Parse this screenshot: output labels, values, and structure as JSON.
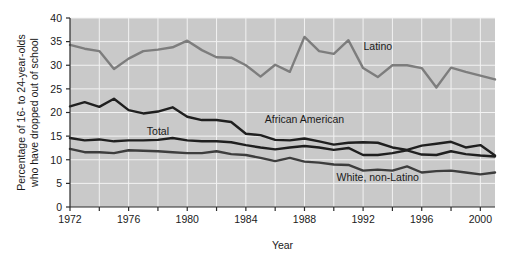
{
  "chart_data": {
    "type": "line",
    "title": "",
    "xlabel": "Year",
    "ylabel": "Percentage of 16- to 24-year-olds who have dropped out of school",
    "ylabel_line1": "Percentage of 16- to 24-year-olds",
    "ylabel_line2": "who have dropped out of school",
    "xlim": [
      1972,
      2001
    ],
    "ylim": [
      0,
      40
    ],
    "yticks": [
      0,
      5,
      10,
      15,
      20,
      25,
      30,
      35,
      40
    ],
    "ytick_labels": [
      "0",
      "5",
      "10",
      "15",
      "20",
      "25",
      "30",
      "35",
      "40"
    ],
    "xticks": [
      1972,
      1974,
      1976,
      1978,
      1980,
      1982,
      1984,
      1986,
      1988,
      1990,
      1992,
      1994,
      1996,
      1998,
      2000
    ],
    "xtick_labels": [
      "1972",
      "",
      "1976",
      "",
      "1980",
      "",
      "1984",
      "",
      "1988",
      "",
      "1992",
      "",
      "1996",
      "",
      "2000"
    ],
    "xtick_labels_shown": [
      "1972",
      "1976",
      "1980",
      "1984",
      "1988",
      "1992",
      "1996",
      "2000"
    ],
    "grid": true,
    "grid_color": "#f2f2f2",
    "plot_background": "#c9c9c9",
    "legend_position": "inline-annotations",
    "x": [
      1972,
      1973,
      1974,
      1975,
      1976,
      1977,
      1978,
      1979,
      1980,
      1981,
      1982,
      1983,
      1984,
      1985,
      1986,
      1987,
      1988,
      1989,
      1990,
      1991,
      1992,
      1993,
      1994,
      1995,
      1996,
      1997,
      1998,
      1999,
      2000,
      2001
    ],
    "series": [
      {
        "name": "Latino",
        "color": "#7d7d7d",
        "stroke_width": 2.4,
        "label_x": 1993,
        "label_y": 33.2,
        "values": [
          34.3,
          33.5,
          33.0,
          29.2,
          31.4,
          33.0,
          33.3,
          33.8,
          35.2,
          33.2,
          31.7,
          31.6,
          30.0,
          27.6,
          30.1,
          28.6,
          36.0,
          33.0,
          32.4,
          35.3,
          29.4,
          27.5,
          30.0,
          30.0,
          29.4,
          25.3,
          29.5,
          28.6,
          27.8,
          27.0
        ]
      },
      {
        "name": "African American",
        "color": "#1f1f1f",
        "stroke_width": 2.4,
        "label_x": 1988,
        "label_y": 17.8,
        "values": [
          21.3,
          22.2,
          21.2,
          22.9,
          20.5,
          19.8,
          20.2,
          21.1,
          19.1,
          18.4,
          18.4,
          18.0,
          15.5,
          15.2,
          14.2,
          14.1,
          14.5,
          13.9,
          13.2,
          13.6,
          13.7,
          13.6,
          12.6,
          12.1,
          13.0,
          13.4,
          13.8,
          12.6,
          13.1,
          10.9
        ]
      },
      {
        "name": "Total",
        "color": "#1f1f1f",
        "stroke_width": 2.4,
        "label_x": 1978,
        "label_y": 15.3,
        "values": [
          14.6,
          14.1,
          14.3,
          13.9,
          14.1,
          14.1,
          14.2,
          14.6,
          14.1,
          13.9,
          13.9,
          13.7,
          13.1,
          12.6,
          12.2,
          12.6,
          12.9,
          12.6,
          12.1,
          12.5,
          11.0,
          11.0,
          11.4,
          12.0,
          11.1,
          11.0,
          11.8,
          11.2,
          10.9,
          10.7
        ]
      },
      {
        "name": "White, non-Latino",
        "color": "#3d3d3d",
        "stroke_width": 2.4,
        "label_x": 1993,
        "label_y": 5.6,
        "values": [
          12.3,
          11.6,
          11.6,
          11.4,
          12.0,
          11.9,
          11.8,
          11.6,
          11.4,
          11.4,
          11.8,
          11.2,
          11.0,
          10.4,
          9.7,
          10.4,
          9.6,
          9.4,
          9.0,
          8.9,
          7.7,
          7.9,
          7.7,
          8.6,
          7.3,
          7.6,
          7.7,
          7.3,
          6.9,
          7.3
        ]
      }
    ]
  }
}
